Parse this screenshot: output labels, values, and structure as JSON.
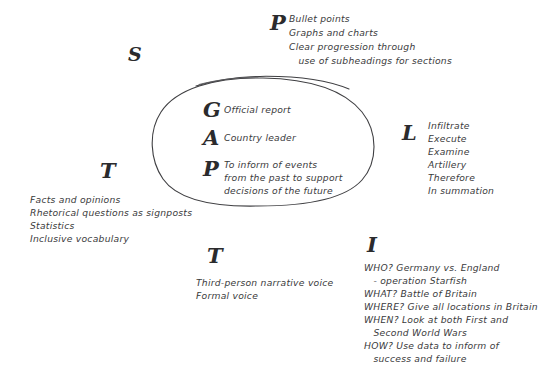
{
  "canvas": {
    "width": 547,
    "height": 373,
    "background": "#ffffff",
    "ink_color": "#3a3a3c",
    "letter_color": "#2b2b2d"
  },
  "center": {
    "shape": "hand-drawn-oval",
    "rows": [
      {
        "letter": "G",
        "text": "Official report"
      },
      {
        "letter": "A",
        "text": "Country leader"
      },
      {
        "letter": "P",
        "lines": [
          "To inform of events",
          "from the past to support",
          "decisions of the future"
        ]
      }
    ]
  },
  "blocks": {
    "s": {
      "letter": "S",
      "lines": []
    },
    "p_top": {
      "letter": "P",
      "lines": [
        "Bullet points",
        "Graphs and charts",
        "Clear progression through",
        "   use of subheadings for sections"
      ]
    },
    "l_right": {
      "letter": "L",
      "lines": [
        "Infiltrate",
        "Execute",
        "Examine",
        "Artillery",
        "Therefore",
        "In summation"
      ]
    },
    "t_left": {
      "letter": "T",
      "lines": [
        "Facts and opinions",
        "Rhetorical questions as signposts",
        "Statistics",
        "Inclusive vocabulary"
      ]
    },
    "t_bottom": {
      "letter": "T",
      "lines": [
        "Third-person narrative voice",
        "Formal voice"
      ]
    },
    "i_bottom_right": {
      "letter": "I",
      "lines": [
        "WHO? Germany vs. England",
        "   - operation Starfish",
        "WHAT? Battle of Britain",
        "WHERE? Give all locations in Britain",
        "WHEN? Look at both First and",
        "   Second World Wars",
        "HOW? Use data to inform of",
        "   success and failure"
      ]
    }
  }
}
